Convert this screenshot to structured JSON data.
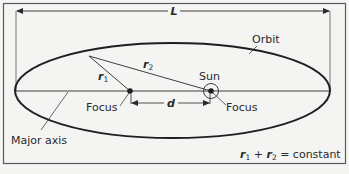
{
  "diagram": {
    "labels": {
      "length": "L",
      "orbit": "Orbit",
      "sun": "Sun",
      "focus_left": "Focus",
      "focus_right": "Focus",
      "distance": "d",
      "major_axis": "Major axis",
      "r1": "r",
      "r1_sub": "1",
      "r2": "r",
      "r2_sub": "2"
    },
    "equation": {
      "r1": "r",
      "r1_sub": "1",
      "plus": " + ",
      "r2": "r",
      "r2_sub": "2",
      "rest": " = constant"
    },
    "colors": {
      "background": "#f4f4f2",
      "stroke": "#1f1f1f",
      "frame": "#5a5a5a"
    }
  }
}
